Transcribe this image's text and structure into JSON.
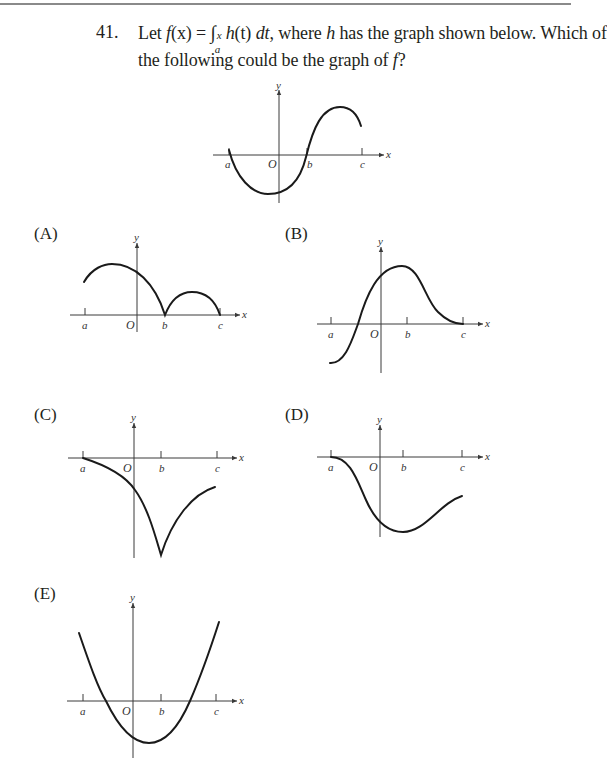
{
  "question": {
    "number": "41.",
    "line1_prefix": "Let ",
    "f": "f",
    "fx_arg": "(x)",
    "equals": " = ",
    "integral": "∫",
    "lower_limit": "a",
    "upper_limit": "x",
    "integrand": "h",
    "integrand_arg": "(t) ",
    "dt": "dt",
    "line1_suffix_a": ", where ",
    "h": "h",
    "line1_suffix_b": " has the graph shown below. Which of",
    "line2_prefix": "the following could be the graph of ",
    "line2_f": "f",
    "line2_suffix": "?"
  },
  "axis_labels": {
    "x": "x",
    "y": "y",
    "origin": "O",
    "a": "a",
    "b": "b",
    "c": "c"
  },
  "given_graph": {
    "name": "graph of h",
    "description": "starts at 0 at a, dips to a minimum just left of O, crosses zero at b, rises to a maximum between b and c, then decreases toward c"
  },
  "options": [
    {
      "label": "(A)",
      "description": "positive from a, max left of O, touches 0 with cusp at b, second hump, returns to 0 at c"
    },
    {
      "label": "(B)",
      "description": "negative near a, crosses zero left of O, max near b, decreases to 0 at c"
    },
    {
      "label": "(C)",
      "description": "0 at a, decreasing, sharp cusp minimum at b, increases toward c (still negative)"
    },
    {
      "label": "(D)",
      "description": "0 at a with horizontal tangent, decreasing, smooth minimum at b, increasing toward c"
    },
    {
      "label": "(E)",
      "description": "parabola opening up, positive near a, crosses zero between a and O, minimum between O and b, crosses zero between b and c"
    }
  ]
}
